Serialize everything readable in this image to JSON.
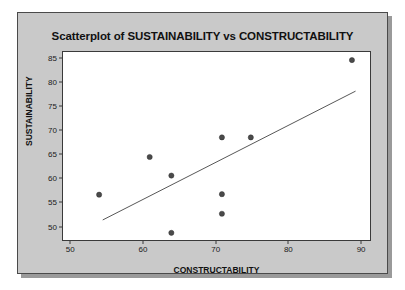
{
  "figure": {
    "panel_background": "#c9c9c9",
    "plot_background": "#ffffff",
    "border_color": "#4a4a4a"
  },
  "axis": {
    "x_label": "CONSTRUCTABILITY",
    "y_label": "SUSTAINABILITY",
    "x_ticks": [
      "50",
      "60",
      "70",
      "80",
      "90"
    ],
    "y_ticks": [
      "50",
      "55",
      "60",
      "65",
      "70",
      "75",
      "80",
      "85"
    ]
  },
  "chart_data": {
    "type": "scatter",
    "title": "Scatterplot of SUSTAINABILITY vs CONSTRUCTABILITY",
    "xlabel": "CONSTRUCTABILITY",
    "ylabel": "SUSTAINABILITY",
    "xlim": [
      49,
      91.5
    ],
    "ylim": [
      46.8,
      86.2
    ],
    "xticks": [
      50,
      60,
      70,
      80,
      90
    ],
    "yticks": [
      50,
      55,
      60,
      65,
      70,
      75,
      80,
      85
    ],
    "grid": false,
    "legend": null,
    "marker_color": "#4a4a4a",
    "points": [
      {
        "x": 54.0,
        "y": 56.3
      },
      {
        "x": 61.0,
        "y": 64.2
      },
      {
        "x": 64.0,
        "y": 60.3
      },
      {
        "x": 64.0,
        "y": 48.3
      },
      {
        "x": 71.0,
        "y": 68.3
      },
      {
        "x": 71.0,
        "y": 56.4
      },
      {
        "x": 71.0,
        "y": 52.3
      },
      {
        "x": 75.0,
        "y": 68.3
      },
      {
        "x": 89.0,
        "y": 84.5
      }
    ],
    "fit_line": {
      "type": "linear-regression",
      "color": "#555555",
      "x_start": 54.5,
      "y_start": 51.0,
      "x_end": 89.5,
      "y_end": 78.0
    }
  }
}
